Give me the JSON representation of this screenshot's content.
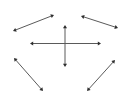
{
  "diagram": {
    "line_color": "#5a5a5a",
    "head_color": "#2e2e2e",
    "background": "#ffffff",
    "arrows": [
      {
        "name": "top-left-diagonal",
        "x1": 13,
        "y1": 31,
        "x2": 54,
        "y2": 15
      },
      {
        "name": "top-right-diagonal",
        "x1": 81,
        "y1": 16,
        "x2": 118,
        "y2": 28
      },
      {
        "name": "center-horizontal",
        "x1": 30,
        "y1": 43.5,
        "x2": 101,
        "y2": 43.5
      },
      {
        "name": "center-vertical",
        "x1": 65,
        "y1": 25,
        "x2": 65,
        "y2": 67
      },
      {
        "name": "bottom-left-diagonal",
        "x1": 14,
        "y1": 58,
        "x2": 43,
        "y2": 91
      },
      {
        "name": "bottom-right-diagonal",
        "x1": 115,
        "y1": 60,
        "x2": 87,
        "y2": 91
      }
    ]
  }
}
